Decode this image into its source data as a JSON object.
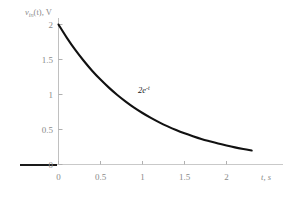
{
  "chart_data": {
    "type": "line",
    "title": "",
    "subtitle": "",
    "xlabel": "t, s",
    "ylabel": "v_in(t), V",
    "ylabel_base": "v",
    "ylabel_sub": "in",
    "ylabel_arg": "(t), V",
    "xlim": [
      -0.1,
      2.45
    ],
    "ylim": [
      0,
      2.15
    ],
    "xticks": [
      0,
      0.5,
      1,
      1.5,
      2
    ],
    "xtick_labels": [
      "0",
      "0.5",
      "1",
      "1.5",
      "2"
    ],
    "yticks": [
      0,
      0.5,
      1,
      1.5,
      2
    ],
    "ytick_labels": [
      "0",
      "0.5",
      "1",
      "1.5",
      "2"
    ],
    "grid": false,
    "legend": "none",
    "annotations": [
      {
        "text": "2e",
        "exponent": "-t",
        "full": "2e^{-t}",
        "x": 0.95,
        "y": 1.0
      }
    ],
    "series": [
      {
        "name": "2e^{-t}",
        "equation": "v = 2*exp(-t)",
        "color": "#111111",
        "linewidth": 2.1,
        "x": [
          0,
          0.1,
          0.2,
          0.3,
          0.4,
          0.5,
          0.6,
          0.7,
          0.8,
          0.9,
          1.0,
          1.1,
          1.2,
          1.3,
          1.4,
          1.5,
          1.6,
          1.7,
          1.8,
          1.9,
          2.0,
          2.1,
          2.2,
          2.3
        ],
        "values": [
          2.0,
          1.81,
          1.637,
          1.482,
          1.34,
          1.213,
          1.098,
          0.993,
          0.899,
          0.813,
          0.736,
          0.666,
          0.602,
          0.545,
          0.493,
          0.446,
          0.404,
          0.365,
          0.331,
          0.299,
          0.271,
          0.245,
          0.222,
          0.2
        ]
      }
    ],
    "colors": {
      "curve": "#111111",
      "axis": "#b8b8b8",
      "tick_label": "#8a8a8a",
      "baseline_accent": "#1a1a1a",
      "background": "#ffffff"
    }
  }
}
